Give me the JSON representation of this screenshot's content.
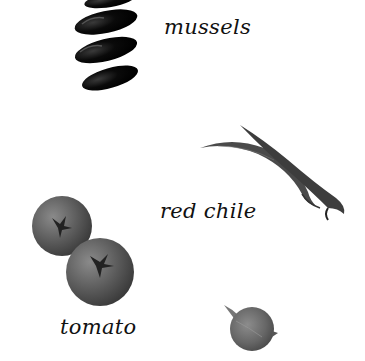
{
  "page": {
    "background": "#ffffff",
    "style": "grayscale ingredient illustration"
  },
  "ingredients": [
    {
      "id": "mussels",
      "label": "mussels",
      "image": "mussels-icon",
      "color": "#0d0d0d"
    },
    {
      "id": "red-chile",
      "label": "red chile",
      "image": "red-chile-icon",
      "color": "#4a4a4a"
    },
    {
      "id": "tomato",
      "label": "tomato",
      "image": "tomato-icon",
      "color": "#5e5e5e"
    },
    {
      "id": "shallot",
      "label": "",
      "image": "shallot-icon",
      "color": "#6a6a6a"
    }
  ]
}
